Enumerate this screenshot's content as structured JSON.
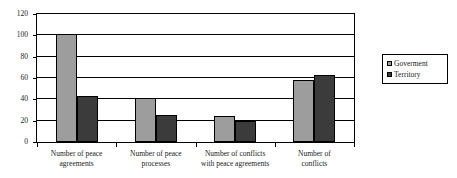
{
  "chart_data": {
    "type": "bar",
    "title": "",
    "subtitle": "",
    "xlabel": "",
    "ylabel": "",
    "ylim": [
      0,
      120
    ],
    "ytick_step": 20,
    "yticks": [
      0,
      20,
      40,
      60,
      80,
      100,
      120
    ],
    "grid": "horizontal",
    "legend_position": "right",
    "categories": [
      "Number of peace agreements",
      "Number of peace processes",
      "Number of conflicts with peace agreements",
      "Number of conflicts"
    ],
    "category_lines": [
      [
        "Number of peace",
        "agreements"
      ],
      [
        "Number of peace",
        "processes"
      ],
      [
        "Number of conflicts",
        "with peace agreements"
      ],
      [
        "Number of conflicts"
      ]
    ],
    "series": [
      {
        "name": "Goverment",
        "color": "#9d9d9d",
        "values": [
          101,
          41,
          24,
          58
        ]
      },
      {
        "name": "Territory",
        "color": "#3b3b3b",
        "values": [
          43,
          25,
          20,
          63
        ]
      }
    ]
  },
  "legend": {
    "entries": [
      {
        "label": "Goverment",
        "color": "#9d9d9d"
      },
      {
        "label": "Territory",
        "color": "#3b3b3b"
      }
    ]
  },
  "colors": {
    "series_government": "#9d9d9d",
    "series_territory": "#3b3b3b",
    "axis": "#000000",
    "plot_background": "#ffffff",
    "text": "#1a1a1a"
  }
}
